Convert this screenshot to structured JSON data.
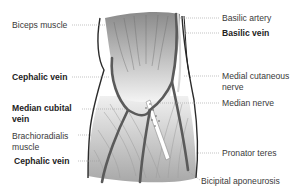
{
  "diagram": {
    "colors": {
      "vein": "#5a5a5a",
      "outline": "#2b2b2b",
      "leader": "#9a9a9a",
      "muscle_dark": "#8a8a8a",
      "muscle_light": "#f2f2f2"
    },
    "labels_left": [
      {
        "id": "biceps-muscle",
        "text": "Biceps muscle",
        "bold": false
      },
      {
        "id": "cephalic-vein-upper",
        "text": "Cephalic vein",
        "bold": true
      },
      {
        "id": "median-cubital-vein",
        "line1": "Median cubital",
        "line2": "vein",
        "bold": true
      },
      {
        "id": "brachioradialis-muscle",
        "line1": "Brachioradialis",
        "line2": "muscle",
        "bold": false
      },
      {
        "id": "cephalic-vein-lower",
        "text": "Cephalic vein",
        "bold": true
      }
    ],
    "labels_right": [
      {
        "id": "basilic-artery",
        "text": "Basilic artery",
        "bold": false
      },
      {
        "id": "basilic-vein",
        "text": "Basilic vein",
        "bold": true
      },
      {
        "id": "medial-cutaneous-nerve",
        "line1": "Medial cutaneous",
        "line2": "nerve",
        "bold": false
      },
      {
        "id": "median-nerve",
        "text": "Median nerve",
        "bold": false
      },
      {
        "id": "pronator-teres",
        "text": "Pronator teres",
        "bold": false
      },
      {
        "id": "bicipital-aponeurosis",
        "text": "Bicipital aponeurosis",
        "bold": false
      }
    ]
  }
}
